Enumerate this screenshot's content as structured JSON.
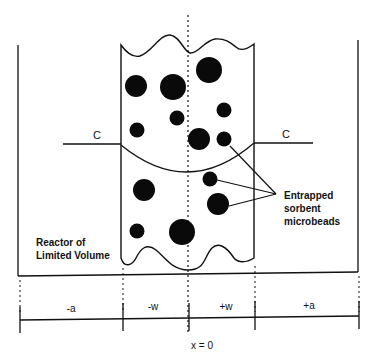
{
  "diagram": {
    "labels": {
      "concentration_left": "C",
      "concentration_right": "C",
      "beads": [
        "Entrapped",
        "sorbent",
        "microbeads"
      ],
      "reactor": [
        "Reactor of",
        "Limited Volume"
      ],
      "origin": "x = 0"
    },
    "axis_segments": [
      {
        "label": "-a"
      },
      {
        "label": "-w"
      },
      {
        "label": "+w"
      },
      {
        "label": "+a"
      }
    ],
    "colors": {
      "ink": "#111111",
      "background": "#ffffff"
    }
  }
}
